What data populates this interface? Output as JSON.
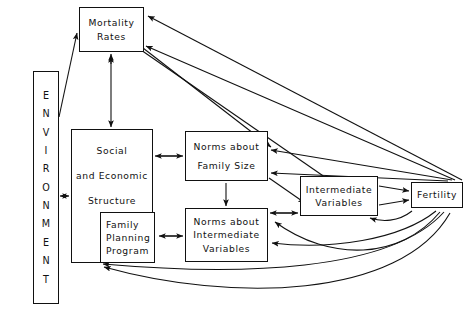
{
  "diagram": {
    "type": "flowchart",
    "stroke_color": "#111111",
    "background_color": "#ffffff",
    "nodes": [
      {
        "id": "environment",
        "name": "environment-box",
        "orientation": "vertical",
        "letters": [
          "E",
          "N",
          "V",
          "I",
          "R",
          "O",
          "N",
          "M",
          "E",
          "N",
          "T"
        ],
        "label": "ENVIRONMENT",
        "x": 33,
        "y": 71,
        "w": 26,
        "h": 233
      },
      {
        "id": "mortality-rates",
        "name": "mortality-rates-box",
        "lines": [
          "Mortality",
          "Rates"
        ],
        "label": "Mortality Rates",
        "x": 79,
        "y": 7,
        "w": 65,
        "h": 45
      },
      {
        "id": "social-economic-structure",
        "name": "social-economic-structure-box",
        "lines": [
          "Social",
          "and  Economic",
          "Structure"
        ],
        "label": "Social and Economic Structure",
        "x": 71,
        "y": 129,
        "w": 82,
        "h": 134
      },
      {
        "id": "family-planning-program",
        "name": "family-planning-program-box",
        "lines": [
          "Family",
          "Planning",
          "Program"
        ],
        "label": "Family Planning Program",
        "x": 100,
        "y": 212,
        "w": 55,
        "h": 51
      },
      {
        "id": "norms-family-size",
        "name": "norms-about-family-size-box",
        "lines": [
          "Norms about",
          "Family  Size"
        ],
        "label": "Norms about Family Size",
        "x": 185,
        "y": 131,
        "w": 83,
        "h": 50
      },
      {
        "id": "norms-intermediate-variables",
        "name": "norms-about-intermediate-variables-box",
        "lines": [
          "Norms about",
          "Intermediate",
          "Variables"
        ],
        "label": "Norms about Intermediate Variables",
        "x": 185,
        "y": 208,
        "w": 83,
        "h": 54
      },
      {
        "id": "intermediate-variables",
        "name": "intermediate-variables-box",
        "lines": [
          "Intermediate",
          "Variables"
        ],
        "label": "Intermediate Variables",
        "x": 300,
        "y": 176,
        "w": 78,
        "h": 40
      },
      {
        "id": "fertility",
        "name": "fertility-box",
        "lines": [
          "Fertility"
        ],
        "label": "Fertility",
        "x": 411,
        "y": 182,
        "w": 52,
        "h": 26
      }
    ],
    "edges": [
      {
        "from": "environment",
        "to": "mortality-rates",
        "style": "straight",
        "direction": "one-way"
      },
      {
        "from": "mortality-rates",
        "to": "social-economic-structure",
        "style": "straight",
        "direction": "two-way"
      },
      {
        "from": "environment",
        "to": "social-economic-structure",
        "style": "straight",
        "direction": "two-way"
      },
      {
        "from": "social-economic-structure",
        "to": "norms-family-size",
        "style": "straight",
        "direction": "two-way"
      },
      {
        "from": "social-economic-structure",
        "to": "family-planning-program",
        "style": "containment",
        "direction": "none"
      },
      {
        "from": "family-planning-program",
        "to": "norms-intermediate-variables",
        "style": "straight",
        "direction": "two-way"
      },
      {
        "from": "norms-family-size",
        "to": "norms-intermediate-variables",
        "style": "straight",
        "direction": "one-way"
      },
      {
        "from": "norms-family-size",
        "to": "intermediate-variables",
        "style": "straight",
        "direction": "one-way"
      },
      {
        "from": "norms-intermediate-variables",
        "to": "intermediate-variables",
        "style": "straight",
        "direction": "two-way"
      },
      {
        "from": "intermediate-variables",
        "to": "fertility",
        "style": "straight",
        "direction": "one-way"
      },
      {
        "from": "intermediate-variables",
        "to": "fertility",
        "style": "straight",
        "direction": "one-way"
      },
      {
        "from": "fertility",
        "to": "intermediate-variables",
        "style": "curved",
        "direction": "one-way"
      },
      {
        "from": "fertility",
        "to": "mortality-rates",
        "style": "straight",
        "direction": "one-way"
      },
      {
        "from": "fertility",
        "to": "mortality-rates",
        "style": "straight",
        "direction": "one-way"
      },
      {
        "from": "fertility",
        "to": "norms-family-size",
        "style": "straight",
        "direction": "one-way"
      },
      {
        "from": "fertility",
        "to": "norms-family-size",
        "style": "straight",
        "direction": "one-way"
      },
      {
        "from": "fertility",
        "to": "norms-intermediate-variables",
        "style": "curved",
        "direction": "one-way"
      },
      {
        "from": "fertility",
        "to": "family-planning-program",
        "style": "curved",
        "direction": "one-way"
      },
      {
        "from": "fertility",
        "to": "social-economic-structure",
        "style": "curved",
        "direction": "one-way"
      }
    ]
  }
}
